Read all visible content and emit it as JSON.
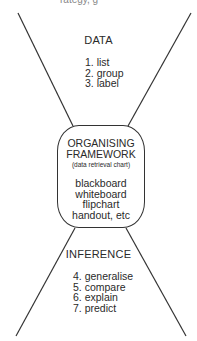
{
  "diagram": {
    "top_cropped_text": "rategy, g",
    "top_section": {
      "heading": "DATA",
      "steps": [
        "1. list",
        "2. group",
        "3. label"
      ]
    },
    "center_box": {
      "title_line1": "ORGANISING",
      "title_line2": "FRAMEWORK",
      "subtitle": "(data retrieval chart)",
      "media": [
        "blackboard",
        "whiteboard",
        "flipchart",
        "handout, etc"
      ]
    },
    "bottom_section": {
      "heading": "INFERENCE",
      "steps": [
        "4. generalise",
        "5. compare",
        "6. explain",
        "7. predict"
      ]
    },
    "colors": {
      "line": "#333333",
      "text": "#2a2a2a",
      "background": "#ffffff"
    }
  }
}
